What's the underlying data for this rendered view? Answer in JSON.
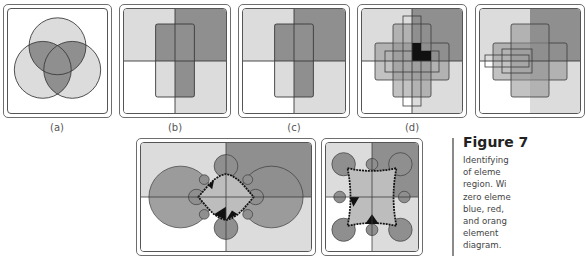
{
  "figure": {
    "title": "Figure 7",
    "caption_lines": [
      "Identifying",
      "of  eleme",
      "region. Wi",
      "zero eleme",
      "blue, red,",
      "and orang",
      "element",
      "diagram."
    ]
  },
  "panels": [
    {
      "id": "a",
      "label": "(a)",
      "content": "three-circle-venn"
    },
    {
      "id": "b",
      "label": "(b)",
      "content": "quadrants-with-rectangle"
    },
    {
      "id": "c",
      "label": "(c)",
      "content": "quadrants-with-rectangle"
    },
    {
      "id": "d",
      "label": "(d)",
      "content": "quadrants-with-cross-rectangles"
    },
    {
      "id": "e",
      "label": "",
      "content": "quadrants-with-nested-rectangles-partial"
    },
    {
      "id": "f",
      "label": "",
      "content": "fractal-circles-wide"
    },
    {
      "id": "g",
      "label": "",
      "content": "fractal-circles-square"
    }
  ],
  "colors": {
    "light": "#dcdcdc",
    "mid": "#8f8f8f",
    "dark": "#1a1a1a",
    "white": "#ffffff",
    "stroke": "#3a3a3a"
  }
}
